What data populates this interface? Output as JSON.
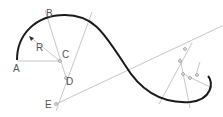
{
  "diagram": {
    "type": "geometric-construction",
    "labels": {
      "A": "A",
      "B": "B",
      "C": "C",
      "D": "D",
      "E": "E",
      "R": "R"
    },
    "colors": {
      "curve": "#1a1a1a",
      "construction": "#9a9a9a",
      "label": "#555555"
    }
  }
}
